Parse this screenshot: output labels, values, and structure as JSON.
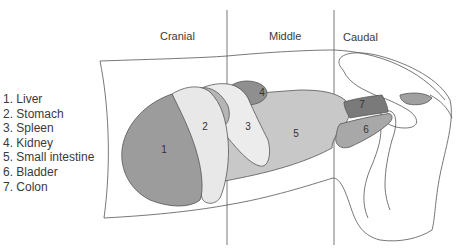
{
  "regions": [
    {
      "label": "Cranial",
      "x": 160,
      "y": 30
    },
    {
      "label": "Middle",
      "x": 269,
      "y": 30
    },
    {
      "label": "Caudal",
      "x": 343,
      "y": 31
    }
  ],
  "legend": [
    {
      "num": "1",
      "label": "1. Liver"
    },
    {
      "num": "2",
      "label": "2. Stomach"
    },
    {
      "num": "3",
      "label": "3. Spleen"
    },
    {
      "num": "4",
      "label": "4. Kidney"
    },
    {
      "num": "5",
      "label": "5. Small intestine"
    },
    {
      "num": "6",
      "label": "6. Bladder"
    },
    {
      "num": "7",
      "label": "7. Colon"
    }
  ],
  "organ_numbers": {
    "liver": "1",
    "stomach": "2",
    "spleen": "3",
    "kidney": "4",
    "small_intestine": "5",
    "bladder": "6",
    "colon": "7"
  },
  "colors": {
    "liver": "#9c9c9c",
    "stomach": "#e8e8e8",
    "spleen": "#ececec",
    "kidney": "#8f8f8f",
    "small_intestine": "#c8c8c8",
    "bladder": "#a8a8a8",
    "colon": "#7a7a7a",
    "outline": "#555555"
  }
}
